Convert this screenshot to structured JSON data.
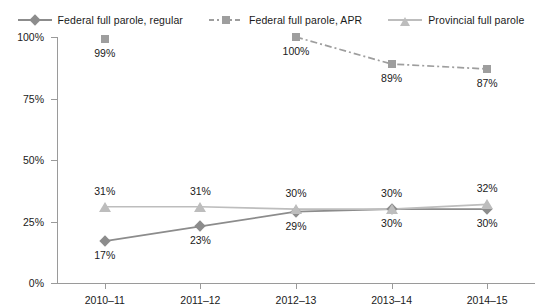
{
  "legend": {
    "items": [
      {
        "label": "Federal full parole, regular",
        "marker": "diamond-marker",
        "color": "#8c8c8c",
        "line": "solid"
      },
      {
        "label": "Federal full parole, APR",
        "marker": "square-marker",
        "color": "#9e9e9e",
        "line": "dashdot"
      },
      {
        "label": "Provincial full parole",
        "marker": "triangle-marker",
        "color": "#bdbdbd",
        "line": "solid"
      }
    ]
  },
  "yaxis": {
    "ticks": [
      "0%",
      "25%",
      "50%",
      "75%",
      "100%"
    ],
    "values": [
      0,
      25,
      50,
      75,
      100
    ]
  },
  "xaxis": {
    "categories": [
      "2010–11",
      "2011–12",
      "2012–13",
      "2013–14",
      "2014–15"
    ]
  },
  "chart_data": {
    "type": "line",
    "title": "",
    "subtitle": "",
    "xlabel": "",
    "ylabel": "",
    "ylim": [
      0,
      100
    ],
    "yticks": [
      0,
      25,
      50,
      75,
      100
    ],
    "ytick_labels": [
      "0%",
      "25%",
      "50%",
      "75%",
      "100%"
    ],
    "grid": false,
    "legend_position": "top",
    "categories": [
      "2010–11",
      "2011–12",
      "2012–13",
      "2013–14",
      "2014–15"
    ],
    "series": [
      {
        "name": "Federal full parole, regular",
        "values": [
          17,
          23,
          29,
          30,
          30
        ],
        "labels": [
          "17%",
          "23%",
          "29%",
          "30%",
          "30%"
        ],
        "label_position": "below",
        "color": "#8c8c8c",
        "marker": "diamond",
        "linestyle": "solid"
      },
      {
        "name": "Federal full parole, APR",
        "values": [
          99,
          null,
          100,
          89,
          87
        ],
        "labels": [
          "99%",
          "",
          "100%",
          "89%",
          "87%"
        ],
        "label_position": "below",
        "color": "#9e9e9e",
        "marker": "square",
        "linestyle": "dashdot"
      },
      {
        "name": "Provincial full parole",
        "values": [
          31,
          31,
          30,
          30,
          32
        ],
        "labels": [
          "31%",
          "31%",
          "30%",
          "30%",
          "32%"
        ],
        "label_position": "above",
        "color": "#bdbdbd",
        "marker": "triangle",
        "linestyle": "solid"
      }
    ]
  }
}
